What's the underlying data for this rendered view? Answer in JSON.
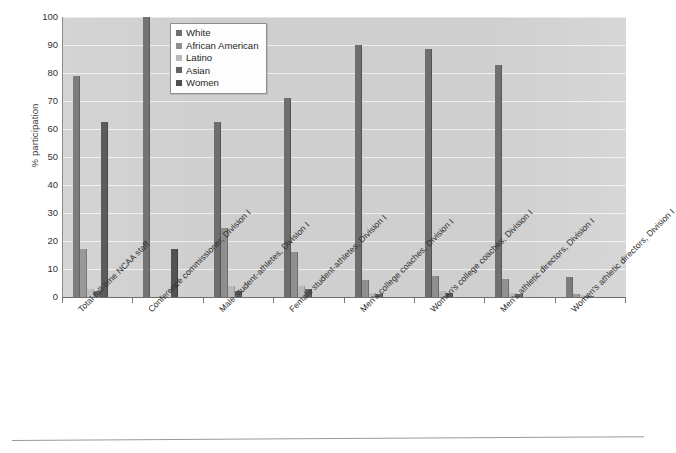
{
  "chart_data": {
    "type": "bar",
    "title": "",
    "xlabel": "",
    "ylabel": "% participation",
    "ylim": [
      0,
      100
    ],
    "ytick_step": 10,
    "grid": true,
    "legend_position": "top-center",
    "yticks": [
      "0",
      "10",
      "20",
      "30",
      "40",
      "50",
      "60",
      "70",
      "80",
      "90",
      "100"
    ],
    "categories": [
      "Total full-time NCAA staff",
      "Conference commissioner, Division I",
      "Male student-athletes, Division I",
      "Female student-athletes, Division I",
      "Men's college coaches, Division I",
      "Women's college coaches, Division I",
      "Men's athletic directors, Division I",
      "Women's athletic directors, Division I"
    ],
    "series": [
      {
        "name": "White",
        "color": "#6e6e6e",
        "values": [
          79,
          100,
          62.5,
          71,
          90,
          88.5,
          83,
          7
        ]
      },
      {
        "name": "African American",
        "color": "#8f8f8f",
        "values": [
          17,
          0,
          24.5,
          16,
          6,
          7.5,
          6.5,
          1
        ]
      },
      {
        "name": "Latino",
        "color": "#b9b9b9",
        "values": [
          3,
          0,
          4,
          4,
          1.5,
          2,
          1.5,
          0.8
        ]
      },
      {
        "name": "Asian",
        "color": "#636363",
        "values": [
          2,
          0,
          2,
          3,
          1,
          1.5,
          1,
          0.4
        ]
      },
      {
        "name": "Women",
        "color": "#4f4f4f",
        "values": [
          62.5,
          17,
          0,
          0,
          0,
          0,
          0,
          0
        ]
      }
    ]
  },
  "legend": {
    "items": [
      {
        "label": "White"
      },
      {
        "label": "African American"
      },
      {
        "label": "Latino"
      },
      {
        "label": "Asian"
      },
      {
        "label": "Women"
      }
    ]
  }
}
